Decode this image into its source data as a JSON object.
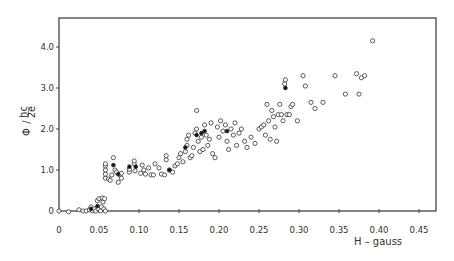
{
  "chart_data": {
    "type": "scatter",
    "title": "",
    "xlabel": "H – gauss",
    "ylabel": "Φ / (hc/2e)",
    "ylabel_parts": {
      "symbol": "Φ",
      "slash": "/",
      "num": "hc",
      "den": "2e"
    },
    "xlim": [
      0,
      0.475
    ],
    "ylim": [
      0,
      4.7
    ],
    "grid": false,
    "legend": null,
    "x_ticks": [
      0,
      0.05,
      0.1,
      0.15,
      0.2,
      0.25,
      0.3,
      0.35,
      0.4,
      0.45
    ],
    "x_tick_labels": [
      "0",
      "0.05",
      "0.10",
      "0.15",
      "0.20",
      "0.25",
      "0.30",
      "0.35",
      "0.40",
      "0.45"
    ],
    "y_ticks": [
      0,
      1.0,
      2.0,
      3.0,
      4.0
    ],
    "y_tick_labels": [
      "0",
      "1.0",
      "2.0",
      "3.0",
      "4.0"
    ],
    "series": [
      {
        "name": "open circles",
        "marker": "open-circle",
        "points": [
          [
            0.0,
            0.0
          ],
          [
            0.012,
            -0.02
          ],
          [
            0.025,
            0.03
          ],
          [
            0.03,
            0.0
          ],
          [
            0.034,
            0.0
          ],
          [
            0.038,
            0.03
          ],
          [
            0.04,
            0.1
          ],
          [
            0.042,
            0.0
          ],
          [
            0.044,
            0.05
          ],
          [
            0.046,
            0.0
          ],
          [
            0.048,
            0.25
          ],
          [
            0.049,
            0.05
          ],
          [
            0.05,
            0.3
          ],
          [
            0.052,
            0.0
          ],
          [
            0.053,
            0.1
          ],
          [
            0.054,
            0.32
          ],
          [
            0.055,
            0.22
          ],
          [
            0.056,
            0.05
          ],
          [
            0.057,
            0.3
          ],
          [
            0.058,
            0.0
          ],
          [
            0.058,
            0.8
          ],
          [
            0.058,
            0.9
          ],
          [
            0.058,
            1.0
          ],
          [
            0.058,
            1.1
          ],
          [
            0.058,
            1.15
          ],
          [
            0.062,
            0.78
          ],
          [
            0.064,
            0.75
          ],
          [
            0.066,
            0.88
          ],
          [
            0.068,
            1.3
          ],
          [
            0.07,
            1.0
          ],
          [
            0.072,
            0.95
          ],
          [
            0.074,
            0.7
          ],
          [
            0.076,
            0.88
          ],
          [
            0.078,
            0.8
          ],
          [
            0.078,
            0.92
          ],
          [
            0.088,
            0.95
          ],
          [
            0.088,
            1.02
          ],
          [
            0.094,
            1.15
          ],
          [
            0.094,
            1.22
          ],
          [
            0.095,
            0.98
          ],
          [
            0.102,
            0.92
          ],
          [
            0.104,
            1.12
          ],
          [
            0.106,
            1.0
          ],
          [
            0.108,
            0.9
          ],
          [
            0.112,
            1.05
          ],
          [
            0.115,
            0.88
          ],
          [
            0.118,
            0.88
          ],
          [
            0.12,
            1.15
          ],
          [
            0.125,
            1.05
          ],
          [
            0.128,
            0.9
          ],
          [
            0.132,
            0.88
          ],
          [
            0.134,
            1.25
          ],
          [
            0.134,
            1.35
          ],
          [
            0.138,
            1.0
          ],
          [
            0.142,
            0.95
          ],
          [
            0.145,
            1.1
          ],
          [
            0.148,
            1.15
          ],
          [
            0.15,
            1.3
          ],
          [
            0.152,
            1.4
          ],
          [
            0.155,
            1.2
          ],
          [
            0.158,
            1.45
          ],
          [
            0.16,
            1.6
          ],
          [
            0.16,
            1.75
          ],
          [
            0.162,
            1.85
          ],
          [
            0.164,
            1.3
          ],
          [
            0.166,
            1.35
          ],
          [
            0.168,
            1.55
          ],
          [
            0.17,
            1.9
          ],
          [
            0.172,
            2.0
          ],
          [
            0.172,
            2.45
          ],
          [
            0.174,
            1.7
          ],
          [
            0.176,
            1.45
          ],
          [
            0.178,
            1.8
          ],
          [
            0.18,
            1.5
          ],
          [
            0.182,
            2.1
          ],
          [
            0.184,
            1.85
          ],
          [
            0.186,
            1.6
          ],
          [
            0.188,
            1.75
          ],
          [
            0.19,
            2.15
          ],
          [
            0.192,
            1.4
          ],
          [
            0.195,
            1.3
          ],
          [
            0.198,
            2.05
          ],
          [
            0.2,
            1.8
          ],
          [
            0.202,
            2.2
          ],
          [
            0.205,
            1.95
          ],
          [
            0.208,
            2.1
          ],
          [
            0.21,
            1.7
          ],
          [
            0.212,
            1.5
          ],
          [
            0.215,
            2.0
          ],
          [
            0.218,
            1.85
          ],
          [
            0.22,
            2.15
          ],
          [
            0.222,
            1.6
          ],
          [
            0.225,
            1.9
          ],
          [
            0.228,
            2.0
          ],
          [
            0.232,
            1.7
          ],
          [
            0.235,
            1.55
          ],
          [
            0.24,
            1.8
          ],
          [
            0.245,
            1.65
          ],
          [
            0.25,
            2.0
          ],
          [
            0.253,
            2.05
          ],
          [
            0.256,
            2.1
          ],
          [
            0.258,
            1.85
          ],
          [
            0.26,
            2.6
          ],
          [
            0.262,
            2.2
          ],
          [
            0.264,
            1.75
          ],
          [
            0.266,
            2.45
          ],
          [
            0.268,
            2.3
          ],
          [
            0.27,
            2.05
          ],
          [
            0.272,
            1.7
          ],
          [
            0.274,
            2.35
          ],
          [
            0.276,
            2.6
          ],
          [
            0.278,
            2.35
          ],
          [
            0.28,
            2.2
          ],
          [
            0.282,
            3.1
          ],
          [
            0.283,
            3.2
          ],
          [
            0.285,
            2.35
          ],
          [
            0.288,
            2.35
          ],
          [
            0.29,
            2.55
          ],
          [
            0.292,
            2.6
          ],
          [
            0.298,
            2.2
          ],
          [
            0.305,
            3.3
          ],
          [
            0.308,
            3.05
          ],
          [
            0.315,
            2.65
          ],
          [
            0.32,
            2.5
          ],
          [
            0.33,
            2.65
          ],
          [
            0.345,
            3.3
          ],
          [
            0.358,
            2.85
          ],
          [
            0.372,
            3.35
          ],
          [
            0.375,
            2.85
          ],
          [
            0.378,
            3.25
          ],
          [
            0.382,
            3.3
          ],
          [
            0.392,
            4.15
          ]
        ]
      },
      {
        "name": "filled circles",
        "marker": "filled-circle",
        "points": [
          [
            0.04,
            0.05
          ],
          [
            0.048,
            0.12
          ],
          [
            0.068,
            1.12
          ],
          [
            0.074,
            0.9
          ],
          [
            0.088,
            1.08
          ],
          [
            0.096,
            1.08
          ],
          [
            0.138,
            1.0
          ],
          [
            0.158,
            1.55
          ],
          [
            0.172,
            1.85
          ],
          [
            0.178,
            1.9
          ],
          [
            0.182,
            1.95
          ],
          [
            0.21,
            1.95
          ],
          [
            0.283,
            3.0
          ]
        ]
      }
    ]
  }
}
